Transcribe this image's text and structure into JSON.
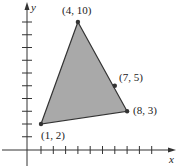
{
  "chart_data": {
    "type": "area",
    "title": "",
    "xlabel": "x",
    "ylabel": "y",
    "xlim": [
      0,
      11
    ],
    "ylim": [
      -1,
      11
    ],
    "grid": false,
    "x_ticks": [
      1,
      2,
      3,
      4,
      5,
      6,
      7,
      8,
      9,
      10
    ],
    "y_ticks": [
      1,
      2,
      3,
      4,
      5,
      6,
      7,
      8,
      9,
      10
    ],
    "polygon": {
      "vertices": [
        [
          4,
          10
        ],
        [
          8,
          3
        ],
        [
          1,
          2
        ]
      ],
      "fill": "#a9a9a9",
      "stroke": "#333333"
    },
    "points": [
      {
        "x": 4,
        "y": 10,
        "label": "(4, 10)"
      },
      {
        "x": 7,
        "y": 5,
        "label": "(7, 5)"
      },
      {
        "x": 8,
        "y": 3,
        "label": "(8, 3)"
      },
      {
        "x": 1,
        "y": 2,
        "label": "(1, 2)"
      }
    ]
  },
  "labels": {
    "x_axis": "x",
    "y_axis": "y",
    "p_4_10": "(4, 10)",
    "p_7_5": "(7, 5)",
    "p_8_3": "(8, 3)",
    "p_1_2": "(1, 2)"
  }
}
